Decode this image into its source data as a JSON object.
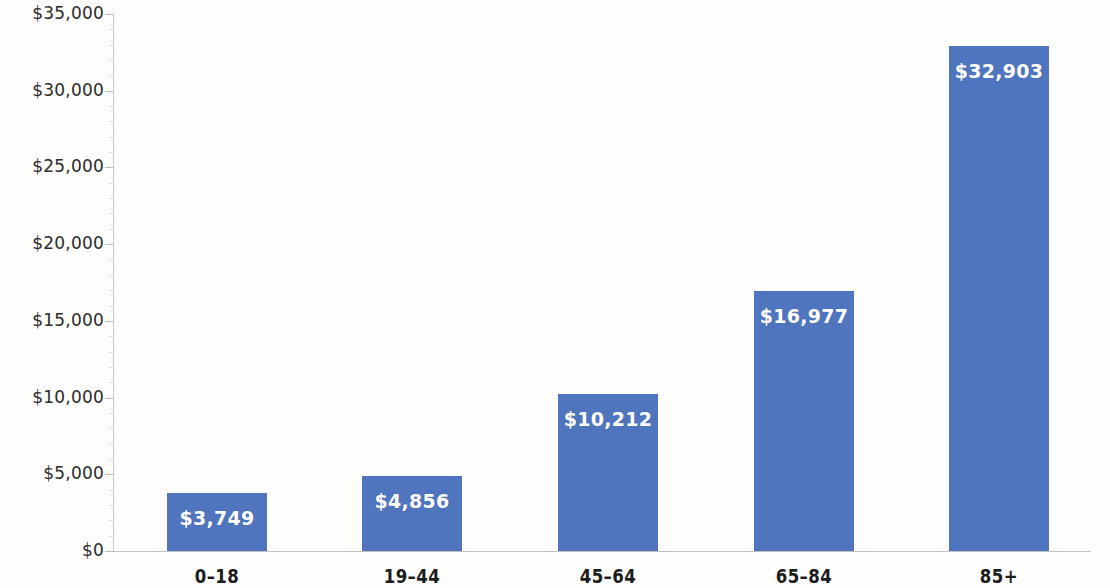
{
  "chart_data": {
    "type": "bar",
    "title": "",
    "subtitle": "",
    "xlabel": "",
    "ylabel": "",
    "categories": [
      "0–18",
      "19–44",
      "45–64",
      "65–84",
      "85+"
    ],
    "values": [
      3749,
      4856,
      10212,
      16977,
      32903
    ],
    "value_labels": [
      "$3,749",
      "$4,856",
      "$10,212",
      "$16,977",
      "$32,903"
    ],
    "series": [
      {
        "name": "",
        "values": [
          3749,
          4856,
          10212,
          16977,
          32903
        ]
      }
    ],
    "ylim": [
      0,
      35000
    ],
    "ytick_values": [
      0,
      5000,
      10000,
      15000,
      20000,
      25000,
      30000,
      35000
    ],
    "ytick_labels": [
      "$0",
      "$5,000",
      "$10,000",
      "$15,000",
      "$20,000",
      "$25,000",
      "$30,000",
      "$35,000"
    ],
    "grid": false,
    "legend": false,
    "legend_position": "none",
    "bar_color": "#4f75be",
    "value_label_color": "#ffffff",
    "axis_color": "#c2c2c2",
    "background_color": "#fdfdfc",
    "annotations": []
  }
}
